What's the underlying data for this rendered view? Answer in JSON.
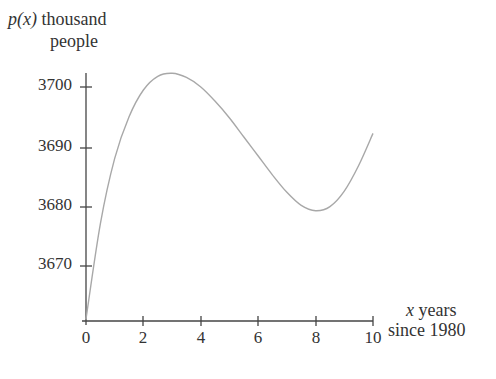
{
  "chart_data": {
    "type": "line",
    "title": "",
    "ylabel_line1_italic": "p(x)",
    "ylabel_line1_rest": " thousand",
    "ylabel_line2": "people",
    "xlabel_line1_italic": "x",
    "xlabel_line1_rest": " years",
    "xlabel_line2": "since 1980",
    "x_ticks": [
      "0",
      "2",
      "4",
      "6",
      "8",
      "10"
    ],
    "y_ticks": [
      "3670",
      "3680",
      "3690",
      "3700"
    ],
    "xlim": [
      0,
      10
    ],
    "ylim": [
      3661,
      3703
    ],
    "grid": false,
    "legend": "none",
    "series": [
      {
        "name": "p(x)",
        "x": [
          0,
          0.5,
          1,
          1.5,
          2,
          2.5,
          3,
          3.5,
          4,
          4.5,
          5,
          5.5,
          6,
          6.5,
          7,
          7.5,
          8,
          8.5,
          9,
          9.5,
          10
        ],
        "y": [
          3661,
          3677,
          3688,
          3695,
          3699.5,
          3701.8,
          3702.3,
          3701.6,
          3700,
          3697.6,
          3694.8,
          3691.6,
          3688.4,
          3685.2,
          3682.3,
          3680.1,
          3679.2,
          3679.9,
          3682.5,
          3686.8,
          3692.2
        ]
      }
    ],
    "annotations": {
      "maximum": {
        "x": 3,
        "y": 3702.3
      },
      "minimum": {
        "x": 8,
        "y": 3679.2
      }
    }
  }
}
